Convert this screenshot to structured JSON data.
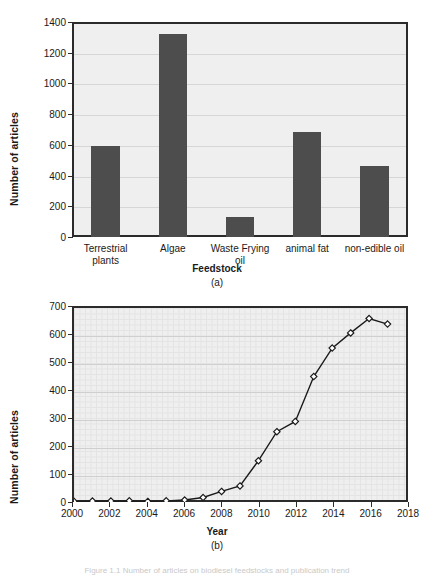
{
  "figure": {
    "panel_a_caption": "(a)",
    "panel_b_caption": "(b)",
    "bottom_caption": "Figure 1.1  Number of articles on biodiesel feedstocks and publication trend"
  },
  "chart_data": [
    {
      "type": "bar",
      "panel": "(a)",
      "title": "",
      "xlabel": "Feedstock",
      "ylabel": "Number of articles",
      "categories": [
        "Terrestrial plants",
        "Algae",
        "Waste Frying oil",
        "animal fat",
        "non-edible oil"
      ],
      "category_lines": [
        [
          "Terrestrial",
          "plants"
        ],
        [
          "Algae"
        ],
        [
          "Waste Frying",
          "oil"
        ],
        [
          "animal fat"
        ],
        [
          "non-edible oil"
        ]
      ],
      "values": [
        595,
        1320,
        130,
        685,
        465
      ],
      "ylim": [
        0,
        1400
      ],
      "yticks": [
        0,
        200,
        400,
        600,
        800,
        1000,
        1200,
        1400
      ],
      "grid": true,
      "legend": "none",
      "bar_color": "#4d4d4d",
      "plot_bg": "#efefef",
      "frame_color": "#2b2b2b"
    },
    {
      "type": "line",
      "panel": "(b)",
      "title": "",
      "xlabel": "Year",
      "ylabel": "Number of articles",
      "x": [
        2000,
        2001,
        2002,
        2003,
        2004,
        2005,
        2006,
        2007,
        2008,
        2009,
        2010,
        2011,
        2012,
        2013,
        2014,
        2015,
        2016,
        2017
      ],
      "values": [
        1,
        2,
        2,
        3,
        1,
        3,
        6,
        15,
        37,
        57,
        148,
        253,
        290,
        452,
        555,
        610,
        662,
        642
      ],
      "ylim": [
        0,
        700
      ],
      "yticks": [
        0,
        100,
        200,
        300,
        400,
        500,
        600,
        700
      ],
      "xlim": [
        2000,
        2018
      ],
      "xticks": [
        2000,
        2002,
        2004,
        2006,
        2008,
        2010,
        2012,
        2014,
        2016,
        2018
      ],
      "grid": true,
      "marker": "diamond",
      "line_color": "#1a1a1a",
      "marker_fill": "#ffffff",
      "plot_bg": "#efefef",
      "frame_color": "#2b2b2b"
    }
  ]
}
